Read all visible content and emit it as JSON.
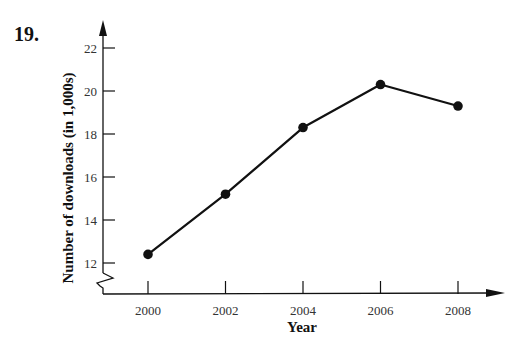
{
  "problem_number": "19.",
  "chart_data": {
    "type": "line",
    "title": "",
    "xlabel": "Year",
    "ylabel": "Number of downloads (in 1,000s)",
    "x": [
      2000,
      2002,
      2004,
      2006,
      2008
    ],
    "categories": [
      "2000",
      "2002",
      "2004",
      "2006",
      "2008"
    ],
    "series": [
      {
        "name": "Downloads",
        "values": [
          12.4,
          15.2,
          18.3,
          20.3,
          19.3
        ]
      }
    ],
    "yticks": [
      12,
      14,
      16,
      18,
      20,
      22
    ],
    "ylim": [
      11,
      23
    ],
    "y_axis_break": true,
    "grid": false,
    "legend": "none",
    "markers": "filled-circle",
    "color": "#111111"
  }
}
